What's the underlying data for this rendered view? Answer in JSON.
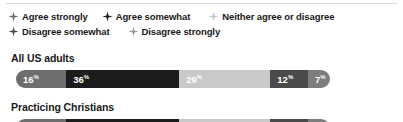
{
  "colors": {
    "agree_strongly": "#6e6e6e",
    "agree_somewhat": "#1c1c1c",
    "neither": "#c9c9c9",
    "disagree_somewhat": "#4a4a4a",
    "disagree_strongly": "#7d7d7d",
    "text": "#1a1a1a",
    "rule": "#d8d8d8"
  },
  "legend": {
    "rows": [
      [
        {
          "label": "Agree strongly",
          "color": "#6e6e6e",
          "icon": "four-point-star-icon"
        },
        {
          "label": "Agree somewhat",
          "color": "#1c1c1c",
          "icon": "four-point-star-icon"
        },
        {
          "label": "Neither agree or disagree",
          "color": "#c9c9c9",
          "icon": "four-point-star-icon"
        }
      ],
      [
        {
          "label": "Disagree somewhat",
          "color": "#4a4a4a",
          "icon": "four-point-star-icon"
        },
        {
          "label": "Disagree strongly",
          "color": "#9a9a9a",
          "icon": "four-point-star-icon"
        }
      ]
    ]
  },
  "series": [
    {
      "title": "All US adults",
      "segments": [
        {
          "label": "Agree strongly",
          "value": 16,
          "value_text": "16",
          "suffix": "%",
          "color": "#6e6e6e",
          "show_label": true
        },
        {
          "label": "Agree somewhat",
          "value": 36,
          "value_text": "36",
          "suffix": "%",
          "color": "#1c1c1c",
          "show_label": true
        },
        {
          "label": "Neither agree or disagree",
          "value": 29,
          "value_text": "29",
          "suffix": "%",
          "color": "#c9c9c9",
          "show_label": true
        },
        {
          "label": "Disagree somewhat",
          "value": 12,
          "value_text": "12",
          "suffix": "%",
          "color": "#4a4a4a",
          "show_label": true
        },
        {
          "label": "Disagree strongly",
          "value": 7,
          "value_text": "7",
          "suffix": "%",
          "color": "#7d7d7d",
          "show_label": true
        }
      ]
    },
    {
      "title": "Practicing Christians",
      "segments": [
        {
          "label": "Agree strongly",
          "value": 16,
          "value_text": "",
          "suffix": "",
          "color": "#6e6e6e",
          "show_label": false
        },
        {
          "label": "Agree somewhat",
          "value": 36,
          "value_text": "",
          "suffix": "",
          "color": "#1c1c1c",
          "show_label": false
        },
        {
          "label": "Neither agree or disagree",
          "value": 29,
          "value_text": "",
          "suffix": "",
          "color": "#c9c9c9",
          "show_label": false
        },
        {
          "label": "Disagree somewhat",
          "value": 12,
          "value_text": "",
          "suffix": "",
          "color": "#4a4a4a",
          "show_label": false
        },
        {
          "label": "Disagree strongly",
          "value": 7,
          "value_text": "",
          "suffix": "",
          "color": "#7d7d7d",
          "show_label": false
        }
      ]
    }
  ],
  "chart_data": {
    "type": "bar",
    "orientation": "horizontal",
    "stacked": true,
    "stack_normalized_percent": true,
    "title": "",
    "xlabel": "",
    "ylabel": "",
    "xlim": [
      0,
      100
    ],
    "grid": false,
    "legend_position": "top",
    "categories": [
      "All US adults",
      "Practicing Christians"
    ],
    "legend_entries": [
      "Agree strongly",
      "Agree somewhat",
      "Neither agree or disagree",
      "Disagree somewhat",
      "Disagree strongly"
    ],
    "series": [
      {
        "name": "Agree strongly",
        "values": [
          16,
          null
        ],
        "color": "#6e6e6e"
      },
      {
        "name": "Agree somewhat",
        "values": [
          36,
          null
        ],
        "color": "#1c1c1c"
      },
      {
        "name": "Neither agree or disagree",
        "values": [
          29,
          null
        ],
        "color": "#c9c9c9"
      },
      {
        "name": "Disagree somewhat",
        "values": [
          12,
          null
        ],
        "color": "#4a4a4a"
      },
      {
        "name": "Disagree strongly",
        "values": [
          7,
          null
        ],
        "color": "#7d7d7d"
      }
    ],
    "data_labels": {
      "All US adults": [
        "16%",
        "36%",
        "29%",
        "12%",
        "7%"
      ],
      "Practicing Christians": []
    }
  }
}
